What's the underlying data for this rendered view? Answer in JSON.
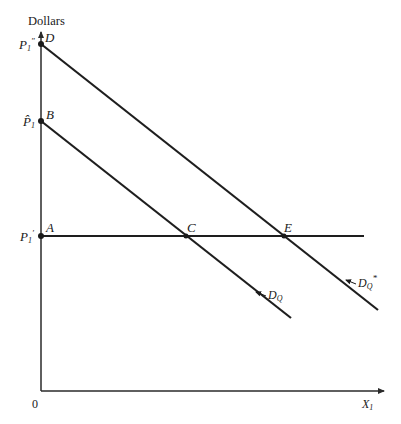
{
  "diagram": {
    "y_axis_title": "Dollars",
    "x_axis_label": "X",
    "x_axis_subscript": "1",
    "origin_label": "0",
    "price_labels": {
      "p1_double_prime": {
        "main": "P",
        "sub": "1",
        "mark": "″"
      },
      "p1_hat": {
        "main": "P̂",
        "sub": "1"
      },
      "p1_prime": {
        "main": "P",
        "sub": "1",
        "mark": "′"
      }
    },
    "points": {
      "A": "A",
      "B": "B",
      "C": "C",
      "D": "D",
      "E": "E"
    },
    "curves": {
      "dq": {
        "main": "D",
        "sub": "Q"
      },
      "dq_star": {
        "main": "D",
        "sub": "Q",
        "sup": "*"
      }
    },
    "colors": {
      "line": "#1e1e1e",
      "background": "#ffffff"
    }
  }
}
